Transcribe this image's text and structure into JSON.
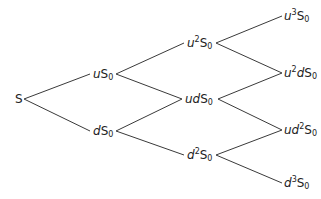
{
  "diagram": {
    "nodes": [
      {
        "id": "S",
        "label": "S",
        "var": "",
        "exp": "",
        "var2": "",
        "exp2": "",
        "sub": "",
        "x": 15,
        "y": 99
      },
      {
        "id": "uS0",
        "label": "uS0",
        "var": "u",
        "exp": "",
        "var2": "",
        "exp2": "",
        "sub": "0",
        "x": 93,
        "y": 74
      },
      {
        "id": "dS0",
        "label": "dS0",
        "var": "d",
        "exp": "",
        "var2": "",
        "exp2": "",
        "sub": "0",
        "x": 93,
        "y": 131
      },
      {
        "id": "u2S0",
        "label": "u2S0",
        "var": "u",
        "exp": "2",
        "var2": "",
        "exp2": "",
        "sub": "0",
        "x": 187,
        "y": 43
      },
      {
        "id": "udS0",
        "label": "udS0",
        "var": "ud",
        "exp": "",
        "var2": "",
        "exp2": "",
        "sub": "0",
        "x": 185,
        "y": 99
      },
      {
        "id": "d2S0",
        "label": "d2S0",
        "var": "d",
        "exp": "2",
        "var2": "",
        "exp2": "",
        "sub": "0",
        "x": 187,
        "y": 155
      },
      {
        "id": "u3S0",
        "label": "u3S0",
        "var": "u",
        "exp": "3",
        "var2": "",
        "exp2": "",
        "sub": "0",
        "x": 284,
        "y": 16
      },
      {
        "id": "u2dS0",
        "label": "u2dS0",
        "var": "u",
        "exp": "2",
        "var2": "d",
        "exp2": "",
        "sub": "0",
        "x": 284,
        "y": 73
      },
      {
        "id": "ud2S0",
        "label": "ud2S0",
        "var": "ud",
        "exp": "2",
        "var2": "",
        "exp2": "",
        "sub": "0",
        "x": 284,
        "y": 130
      },
      {
        "id": "d3S0",
        "label": "d3S0",
        "var": "d",
        "exp": "3",
        "var2": "",
        "exp2": "",
        "sub": "0",
        "x": 284,
        "y": 183
      }
    ],
    "edges": [
      {
        "from": "S",
        "to": "uS0",
        "x1": 24,
        "y1": 99,
        "x2": 90,
        "y2": 74
      },
      {
        "from": "S",
        "to": "dS0",
        "x1": 24,
        "y1": 99,
        "x2": 90,
        "y2": 131
      },
      {
        "from": "uS0",
        "to": "u2S0",
        "x1": 116,
        "y1": 74,
        "x2": 184,
        "y2": 43
      },
      {
        "from": "uS0",
        "to": "udS0",
        "x1": 116,
        "y1": 74,
        "x2": 182,
        "y2": 99
      },
      {
        "from": "dS0",
        "to": "udS0",
        "x1": 116,
        "y1": 131,
        "x2": 182,
        "y2": 99
      },
      {
        "from": "dS0",
        "to": "d2S0",
        "x1": 116,
        "y1": 131,
        "x2": 184,
        "y2": 155
      },
      {
        "from": "u2S0",
        "to": "u3S0",
        "x1": 216,
        "y1": 43,
        "x2": 282,
        "y2": 16
      },
      {
        "from": "u2S0",
        "to": "u2dS0",
        "x1": 216,
        "y1": 43,
        "x2": 282,
        "y2": 73
      },
      {
        "from": "udS0",
        "to": "u2dS0",
        "x1": 218,
        "y1": 99,
        "x2": 282,
        "y2": 73
      },
      {
        "from": "udS0",
        "to": "ud2S0",
        "x1": 218,
        "y1": 99,
        "x2": 282,
        "y2": 130
      },
      {
        "from": "d2S0",
        "to": "ud2S0",
        "x1": 216,
        "y1": 155,
        "x2": 282,
        "y2": 130
      },
      {
        "from": "d2S0",
        "to": "d3S0",
        "x1": 216,
        "y1": 155,
        "x2": 282,
        "y2": 183
      }
    ],
    "colors": {
      "line": "#3a3a3a",
      "text": "#222222",
      "background": "#ffffff"
    }
  }
}
